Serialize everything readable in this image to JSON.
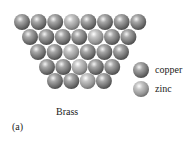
{
  "figure": {
    "title": "Brass",
    "panel_label": "(a)",
    "legend": [
      {
        "key": "copper",
        "label": "copper",
        "color": "#8a8a8a"
      },
      {
        "key": "zinc",
        "label": "zinc",
        "color": "#b4b4b4"
      }
    ],
    "lattice": {
      "sphere_radius": 8,
      "rows": [
        {
          "y": 22,
          "x_start": 22,
          "spacing": 16.6,
          "atoms": [
            "copper",
            "copper",
            "copper",
            "zinc",
            "copper",
            "copper",
            "copper",
            "copper"
          ]
        },
        {
          "y": 37,
          "x_start": 30,
          "spacing": 16.4,
          "atoms": [
            "copper",
            "copper",
            "copper",
            "copper",
            "zinc",
            "copper",
            "copper"
          ]
        },
        {
          "y": 52,
          "x_start": 38,
          "spacing": 16.6,
          "atoms": [
            "copper",
            "copper",
            "zinc",
            "copper",
            "copper",
            "copper"
          ]
        },
        {
          "y": 67,
          "x_start": 47,
          "spacing": 16.3,
          "atoms": [
            "copper",
            "copper",
            "zinc",
            "copper",
            "copper"
          ]
        },
        {
          "y": 81,
          "x_start": 55,
          "spacing": 16.3,
          "atoms": [
            "copper",
            "copper",
            "zinc",
            "copper"
          ]
        }
      ]
    },
    "legend_positions": {
      "copper": {
        "x": 141,
        "y": 70
      },
      "zinc": {
        "x": 141,
        "y": 89
      }
    }
  }
}
